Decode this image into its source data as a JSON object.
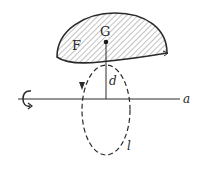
{
  "diagram": {
    "type": "pappus-surface-of-revolution",
    "labels": {
      "figure": "F",
      "centroid": "G",
      "distance": "d",
      "axis": "a",
      "path": "l"
    },
    "colors": {
      "ink": "#2a2a2a",
      "hatch": "#555555",
      "background": "#ffffff"
    },
    "icons": {
      "rotation": "rotation-arrow-icon"
    }
  }
}
